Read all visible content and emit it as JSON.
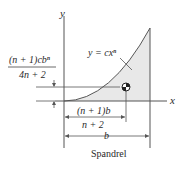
{
  "figure": {
    "caption": "Spandrel",
    "curve_label": "y = cxⁿ",
    "axis_x_label": "x",
    "axis_y_label": "y",
    "centroid_x_label_numerator": "(n + 1)b",
    "centroid_x_label_denominator": "n + 2",
    "centroid_y_label_numerator": "(n + 1)cbⁿ",
    "centroid_y_label_denominator": "4n + 2",
    "width_label": "b"
  },
  "colors": {
    "line": "#555555",
    "fill": "#e8e8e8",
    "text": "#2a2a2a"
  }
}
